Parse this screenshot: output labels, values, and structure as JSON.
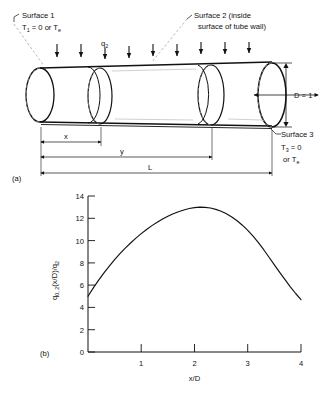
{
  "figure": {
    "panel_a_label": "(a)",
    "panel_b_label": "(b)",
    "diagram": {
      "surface1": {
        "name": "Surface 1",
        "condition_prefix": "T",
        "condition_sub": "1",
        "condition_rest": " = 0  or  T",
        "condition_rest_sub": "e"
      },
      "surface2": {
        "line1": "Surface 2 (inside",
        "line2": "surface of tube wall)"
      },
      "surface3": {
        "name": "Surface 3",
        "condition_prefix": "T",
        "condition_sub": "3",
        "condition_rest": " = 0",
        "condition_line2": "or  T",
        "condition_line2_sub": "e"
      },
      "heat_flux_label": "q",
      "heat_flux_sub": "2",
      "diameter_label": "D = 1",
      "dimensions": [
        {
          "name": "x"
        },
        {
          "name": "y"
        },
        {
          "name": "L"
        }
      ],
      "arrow_count": 9
    }
  },
  "chart_data": {
    "type": "line",
    "title": "",
    "xlabel": "x/D",
    "ylabel": "q0,2(x/D)/q2",
    "ylabel_parts": {
      "main1": "q",
      "sub1": "0, 2",
      "main2": "(x/D)/q",
      "sub2": "2"
    },
    "xlim": [
      0,
      4
    ],
    "ylim": [
      0,
      14
    ],
    "xticks": [
      0,
      1,
      2,
      3,
      4
    ],
    "xtick_labels": [
      "",
      "1",
      "2",
      "3",
      "4"
    ],
    "yticks": [
      0,
      2,
      4,
      6,
      8,
      10,
      12,
      14
    ],
    "ytick_labels": [
      "0",
      "2",
      "4",
      "6",
      "8",
      "10",
      "12",
      "14"
    ],
    "grid": false,
    "legend": null,
    "series": [
      {
        "name": "q0,2(x/D)/q2",
        "x": [
          0.0,
          0.1,
          0.2,
          0.3,
          0.4,
          0.5,
          0.6,
          0.7,
          0.8,
          0.9,
          1.0,
          1.1,
          1.2,
          1.3,
          1.4,
          1.5,
          1.6,
          1.7,
          1.8,
          1.9,
          2.0,
          2.1,
          2.2,
          2.3,
          2.4,
          2.5,
          2.6,
          2.7,
          2.8,
          2.9,
          3.0,
          3.1,
          3.2,
          3.3,
          3.4,
          3.5,
          3.6,
          3.7,
          3.8,
          3.9,
          4.0
        ],
        "values": [
          5.0,
          5.75,
          6.45,
          7.1,
          7.7,
          8.28,
          8.82,
          9.32,
          9.78,
          10.22,
          10.62,
          11.0,
          11.34,
          11.65,
          11.93,
          12.18,
          12.4,
          12.59,
          12.75,
          12.88,
          12.96,
          13.0,
          12.98,
          12.92,
          12.8,
          12.63,
          12.4,
          12.12,
          11.78,
          11.38,
          10.92,
          10.4,
          9.82,
          9.18,
          8.5,
          7.82,
          7.15,
          6.5,
          5.85,
          5.25,
          4.7
        ]
      }
    ],
    "peak": {
      "x": 2.1,
      "y": 13.0
    },
    "start": {
      "x": 0.0,
      "y": 5.0
    },
    "end": {
      "x": 4.0,
      "y": 4.7
    }
  }
}
